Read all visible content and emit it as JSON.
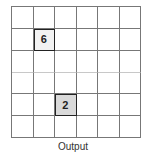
{
  "grid": {
    "rows": 6,
    "cols": 6,
    "light_divider_after_row": 2,
    "highlighted_cells": [
      {
        "row": 1,
        "col": 1,
        "value": "6",
        "fill": "#f2f2f2"
      },
      {
        "row": 4,
        "col": 2,
        "value": "2",
        "fill": "#d9d9d9"
      }
    ]
  },
  "caption": "Output"
}
